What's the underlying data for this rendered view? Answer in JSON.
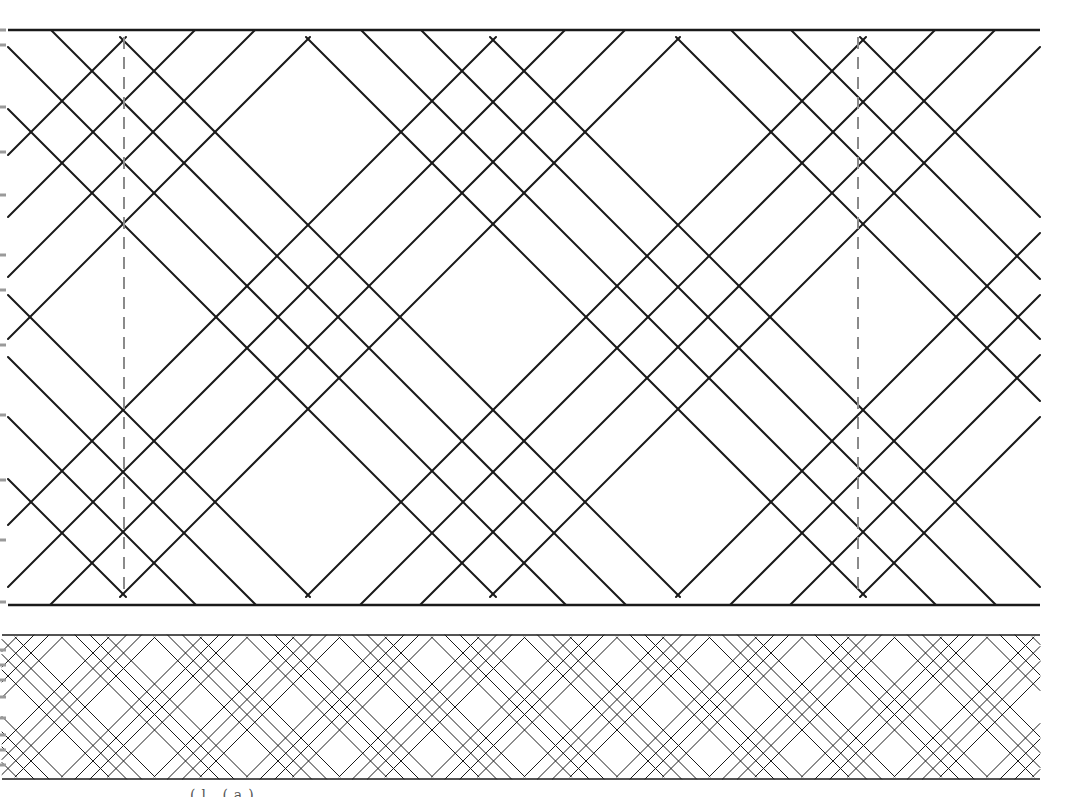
{
  "figure": {
    "width": 1068,
    "height": 797,
    "line_color": "#1a1a1a",
    "guide_color": "#8a8a8a",
    "tick_color": "#9a9a9a",
    "caption_fragment": "(l   (a)"
  },
  "panels": [
    {
      "name": "large-braid-panel",
      "x_left": 8,
      "x_right": 1040,
      "border_top": 30,
      "border_bottom": 605,
      "apex_top": 37,
      "apex_bottom": 597,
      "y_mid": 317,
      "period": 370,
      "group_center_start": 308,
      "inner_offsets": [
        -30,
        30
      ],
      "outer_offsets": [
        -92,
        92
      ],
      "stroke_width": 2,
      "border_width": 2.5,
      "dashed_guides_x": [
        124,
        858
      ],
      "left_ticks_y": [
        30,
        45,
        107,
        152,
        195,
        255,
        290,
        345,
        415,
        480,
        540,
        602
      ]
    },
    {
      "name": "small-braid-panel",
      "x_left": 2,
      "x_right": 1040,
      "border_top": 635,
      "border_bottom": 779,
      "apex_top": 637,
      "apex_bottom": 777,
      "y_mid": 707,
      "period": 92.5,
      "group_center_start": 62,
      "inner_offsets": [
        -7.5,
        7.5
      ],
      "outer_offsets": [
        -23,
        23
      ],
      "stroke_width": 1,
      "border_width": 1.5,
      "dashed_guides_x": [],
      "left_ticks_y": [
        650,
        665,
        680,
        697,
        718,
        735,
        750,
        765
      ]
    }
  ]
}
